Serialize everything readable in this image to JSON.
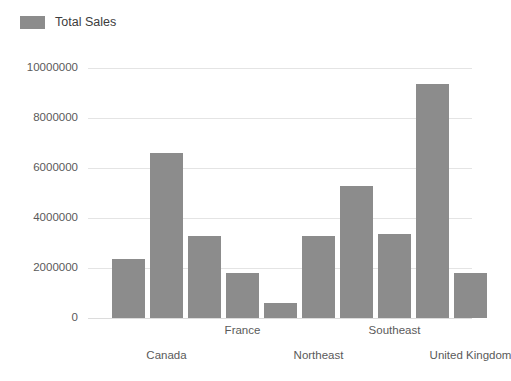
{
  "legend": {
    "items": [
      {
        "label": "Total Sales",
        "color": "#8c8c8c"
      }
    ],
    "position": "top-left"
  },
  "axes": {
    "y_ticks": [
      "0",
      "2000000",
      "4000000",
      "6000000",
      "8000000",
      "10000000"
    ],
    "x_labels": [
      "Canada",
      "France",
      "Northeast",
      "Southeast",
      "United Kingdom"
    ]
  },
  "colors": {
    "bar": "#8c8c8c",
    "gridline": "#e4e4e4",
    "axis": "#dcdcdc",
    "tick_text": "#5a5a5a",
    "legend_text": "#3c3c3c",
    "background": "#ffffff"
  },
  "chart_data": {
    "type": "bar",
    "title": "",
    "xlabel": "",
    "ylabel": "",
    "ylim": [
      0,
      10000000
    ],
    "yticks": [
      0,
      2000000,
      4000000,
      6000000,
      8000000,
      10000000
    ],
    "grid": true,
    "legend_position": "top-left",
    "categories": [
      "",
      "Canada",
      "",
      "France",
      "",
      "Northeast",
      "",
      "Southeast",
      "",
      "United Kingdom"
    ],
    "tick_label_rows": [
      1,
      0,
      1,
      0,
      1
    ],
    "series": [
      {
        "name": "Total Sales",
        "color": "#8c8c8c",
        "values": [
          2350000,
          6600000,
          3300000,
          1800000,
          600000,
          3300000,
          5300000,
          3350000,
          9350000,
          1800000
        ]
      }
    ]
  }
}
